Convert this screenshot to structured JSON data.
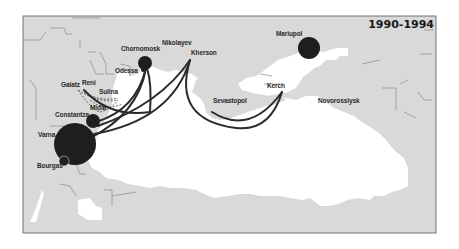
{
  "map": {
    "title": "1990-1994",
    "colors": {
      "land": "#d9d9d9",
      "sea": "#ffffff",
      "border": "#8a8a8a",
      "frame": "#555555",
      "port": "#1e1e1e",
      "route": "#2b2b2b"
    },
    "ports": [
      {
        "name": "Chornomorsk",
        "label": "Chornomosk",
        "x": 145,
        "y": 63,
        "r": 7
      },
      {
        "name": "Nikolayev",
        "label": "Nikolayev",
        "x": 177,
        "y": 56,
        "r": 0
      },
      {
        "name": "Kherson",
        "label": "Kherson",
        "x": 190,
        "y": 58,
        "r": 0
      },
      {
        "name": "Odessa",
        "label": "Odessa",
        "x": 143,
        "y": 72,
        "r": 2
      },
      {
        "name": "Galatz",
        "label": "Galatz",
        "x": 78,
        "y": 85,
        "r": 0
      },
      {
        "name": "Reni",
        "label": "Reni",
        "x": 84,
        "y": 88,
        "r": 0
      },
      {
        "name": "Sulina",
        "label": "Sulina",
        "x": 118,
        "y": 96,
        "r": 0
      },
      {
        "name": "Midia",
        "label": "Midia",
        "x": 100,
        "y": 110,
        "r": 0
      },
      {
        "name": "Constantza",
        "label": "Constantza",
        "x": 93,
        "y": 121,
        "r": 7
      },
      {
        "name": "Varna",
        "label": "Varna",
        "x": 75,
        "y": 144,
        "r": 21
      },
      {
        "name": "Bourgas",
        "label": "Bourgas",
        "x": 64,
        "y": 161,
        "r": 5
      },
      {
        "name": "Sevastopol",
        "label": "Sevastopol",
        "x": 213,
        "y": 110,
        "r": 0
      },
      {
        "name": "Kerch",
        "label": "Kerch",
        "x": 282,
        "y": 91,
        "r": 0
      },
      {
        "name": "Mariupol",
        "label": "Mariupol",
        "x": 309,
        "y": 48,
        "r": 11
      },
      {
        "name": "Novorossiysk",
        "label": "Novorossiysk",
        "x": 335,
        "y": 100,
        "r": 0
      }
    ],
    "routes": [
      {
        "from": "Reni",
        "to": "Chornomorsk",
        "style": "solid"
      },
      {
        "from": "Constantza",
        "to": "Chornomorsk",
        "style": "solid"
      },
      {
        "from": "Varna",
        "to": "Chornomorsk",
        "style": "solid"
      },
      {
        "from": "Varna",
        "to": "Kherson",
        "style": "solid"
      },
      {
        "from": "Constantza",
        "to": "Kherson",
        "style": "solid"
      },
      {
        "from": "Kherson",
        "to": "Kerch",
        "style": "solid"
      },
      {
        "from": "Sevastopol",
        "to": "Kerch",
        "style": "solid"
      },
      {
        "from": "Galatz",
        "to": "Sulina",
        "style": "dashed"
      },
      {
        "from": "Galatz",
        "to": "Midia",
        "style": "dashed"
      },
      {
        "from": "Reni",
        "to": "Sulina",
        "style": "dashed"
      },
      {
        "from": "Midia",
        "to": "Sulina",
        "style": "dashed"
      }
    ]
  }
}
